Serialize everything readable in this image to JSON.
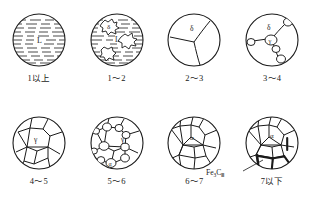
{
  "figure": {
    "title": "",
    "panel_count": 8,
    "stroke_color": "#1a1a1a",
    "background_color": "#ffffff",
    "hatch_color": "#2b2b2b"
  },
  "panels": [
    {
      "id": "panel-1",
      "label": "1以上",
      "phase_labels": [
        "L"
      ],
      "structure": "liquid",
      "description": "fully liquid, horizontal dash hatching"
    },
    {
      "id": "panel-2",
      "label": "1～2",
      "phase_labels": [
        "δ",
        "L"
      ],
      "structure": "liquid-plus-delta-dendrites",
      "description": "liquid with three delta ferrite islands"
    },
    {
      "id": "panel-3",
      "label": "2～3",
      "phase_labels": [
        "δ"
      ],
      "structure": "delta-grains",
      "description": "three delta grains meeting at a triple junction"
    },
    {
      "id": "panel-4",
      "label": "3～4",
      "phase_labels": [
        "δ",
        "γ"
      ],
      "structure": "gamma-nucleating-on-delta-boundaries",
      "description": "delta matrix with gamma nuclei on grain boundaries"
    },
    {
      "id": "panel-5",
      "label": "4～5",
      "phase_labels": [
        "γ"
      ],
      "structure": "gamma-grains",
      "description": "equiaxed austenite grains"
    },
    {
      "id": "panel-6",
      "label": "5～6",
      "phase_labels": [
        "γ",
        "α"
      ],
      "structure": "alpha-nucleating-on-gamma-boundaries",
      "description": "austenite grains with alpha ferrite nuclei at boundaries"
    },
    {
      "id": "panel-7",
      "label": "6～7",
      "phase_labels": [
        "α"
      ],
      "structure": "alpha-grains",
      "description": "equiaxed ferrite grains"
    },
    {
      "id": "panel-8",
      "label": "7以下",
      "phase_labels": [
        "α"
      ],
      "structure": "alpha-grains-with-cementite",
      "description": "ferrite grains with tertiary cementite films on boundaries"
    }
  ],
  "annotations": {
    "cementite": {
      "formula_main": "Fe",
      "formula_sub": "3",
      "formula_c": "C",
      "formula_roman": "Ⅲ",
      "full": "Fe3CⅢ"
    }
  }
}
